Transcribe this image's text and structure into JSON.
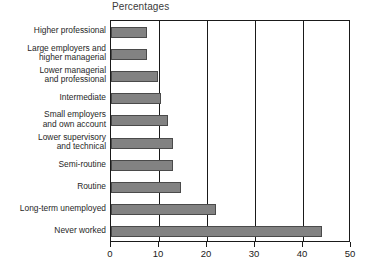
{
  "chart_data": {
    "type": "bar",
    "orientation": "horizontal",
    "title": "Percentages",
    "xlabel": "",
    "ylabel": "",
    "xlim": [
      0,
      50
    ],
    "xticks": [
      0,
      10,
      20,
      30,
      40,
      50
    ],
    "xtick_labels": [
      "0",
      "10",
      "20",
      "30",
      "40",
      "50"
    ],
    "grid": true,
    "legend": false,
    "bar_color": "#828282",
    "bar_border_color": "#4a4a4a",
    "axis_color": "#1a1a1a",
    "categories": [
      "Higher professional",
      "Large employers and\nhigher managerial",
      "Lower managerial\nand professional",
      "Intermediate",
      "Small employers\nand own account",
      "Lower supervisory\nand technical",
      "Semi-routine",
      "Routine",
      "Long-term unemployed",
      "Never worked"
    ],
    "values": [
      7.5,
      7.5,
      9.7,
      10.4,
      11.9,
      12.9,
      13.0,
      14.6,
      21.9,
      44.0
    ]
  }
}
